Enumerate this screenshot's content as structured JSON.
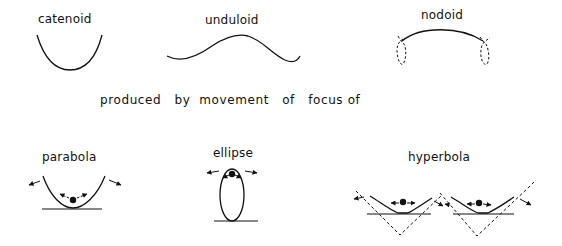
{
  "top_row": {
    "catenoid": {
      "label": "catenoid"
    },
    "unduloid": {
      "label": "unduloid"
    },
    "nodoid": {
      "label": "nodoid"
    }
  },
  "caption": {
    "text": "produced   by  movement   of   focus of"
  },
  "bottom_row": {
    "parabola": {
      "label": "parabola"
    },
    "ellipse": {
      "label": "ellipse"
    },
    "hyperbola": {
      "label": "hyperbola"
    }
  },
  "colors": {
    "ink": "#111111",
    "background": "#ffffff"
  }
}
